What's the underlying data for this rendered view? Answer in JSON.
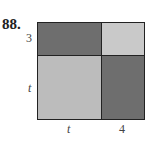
{
  "problem_number": "88.",
  "labels": {
    "left_top": "3",
    "left_bottom": "t",
    "bottom_left": "t",
    "bottom_right": "4"
  },
  "regions": [
    {
      "name": "top-left",
      "width": "t",
      "height": "3",
      "color": "#6e6e6e"
    },
    {
      "name": "top-right",
      "width": "4",
      "height": "3",
      "color": "#c9c9c9"
    },
    {
      "name": "bottom-left",
      "width": "t",
      "height": "t",
      "color": "#bcbcbc"
    },
    {
      "name": "bottom-right",
      "width": "4",
      "height": "t",
      "color": "#6e6e6e"
    }
  ]
}
